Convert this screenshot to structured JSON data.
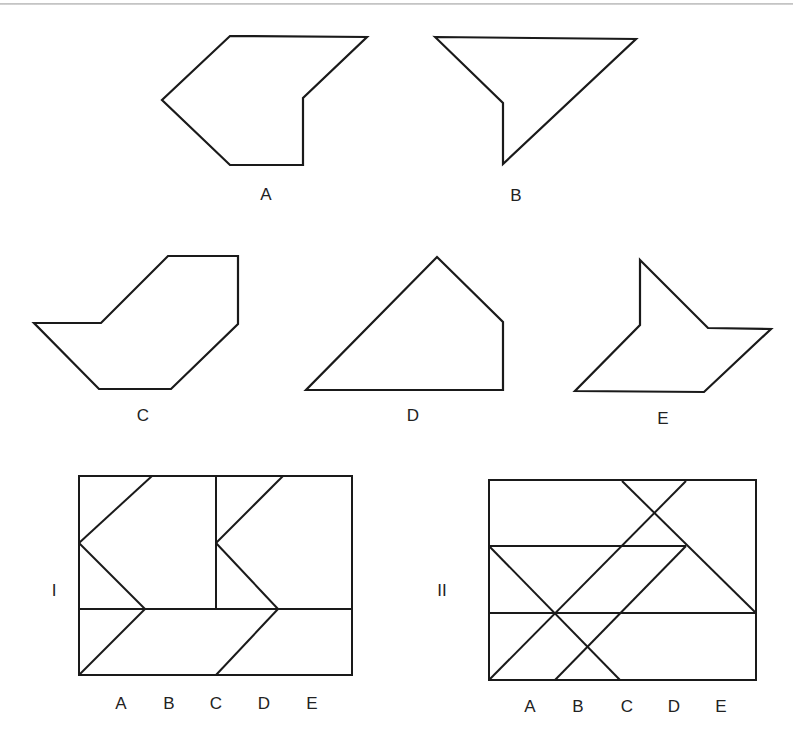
{
  "figure": {
    "shapes": [
      {
        "label": "A",
        "points": "230,36 367,37 303,98 303,165 230,165 162,100",
        "label_pos": [
          266,
          194
        ]
      },
      {
        "label": "B",
        "points": "435,37 636,39 503,164 503,103",
        "label_pos": [
          516,
          195
        ]
      },
      {
        "label": "C",
        "points": "168,256 238,256 238,324 171,389 99,389 34,323 101,323",
        "label_pos": [
          143,
          415
        ]
      },
      {
        "label": "D",
        "points": "437,257 503,322 503,390 306,390",
        "label_pos": [
          413,
          415
        ]
      },
      {
        "label": "E",
        "points": "640,260 708,328 771,329 704,392 575,391 640,325",
        "label_pos": [
          663,
          418
        ]
      }
    ],
    "grids": [
      {
        "name": "I",
        "name_pos": [
          54,
          590
        ],
        "rect": [
          79,
          476,
          273,
          199
        ],
        "lines": [
          [
            79,
            609,
            352,
            609
          ],
          [
            216,
            477,
            216,
            609
          ],
          [
            79,
            543,
            152,
            476
          ],
          [
            79,
            543,
            145,
            609
          ],
          [
            79,
            675,
            145,
            609
          ],
          [
            216,
            543,
            283,
            476
          ],
          [
            216,
            543,
            278,
            609
          ],
          [
            216,
            675,
            278,
            609
          ]
        ],
        "letters": [
          "A",
          "B",
          "C",
          "D",
          "E"
        ],
        "letters_x": [
          121,
          169,
          216,
          264,
          312
        ],
        "letters_y": 703
      },
      {
        "name": "II",
        "name_pos": [
          442,
          590
        ],
        "rect": [
          489,
          480,
          267,
          200
        ],
        "lines": [
          [
            489,
            546,
            686,
            546
          ],
          [
            489,
            613,
            756,
            613
          ],
          [
            489,
            680,
            686,
            481
          ],
          [
            555,
            680,
            686,
            546
          ],
          [
            489,
            546,
            620,
            680
          ],
          [
            622,
            481,
            756,
            613
          ]
        ],
        "letters": [
          "A",
          "B",
          "C",
          "D",
          "E"
        ],
        "letters_x": [
          530,
          578,
          627,
          674,
          721
        ],
        "letters_y": 706
      }
    ]
  },
  "labels": {
    "shape_a": "A",
    "shape_b": "B",
    "shape_c": "C",
    "shape_d": "D",
    "shape_e": "E",
    "grid_i": "I",
    "grid_ii": "II",
    "grid_i_letters": [
      "A",
      "B",
      "C",
      "D",
      "E"
    ],
    "grid_ii_letters": [
      "A",
      "B",
      "C",
      "D",
      "E"
    ]
  }
}
